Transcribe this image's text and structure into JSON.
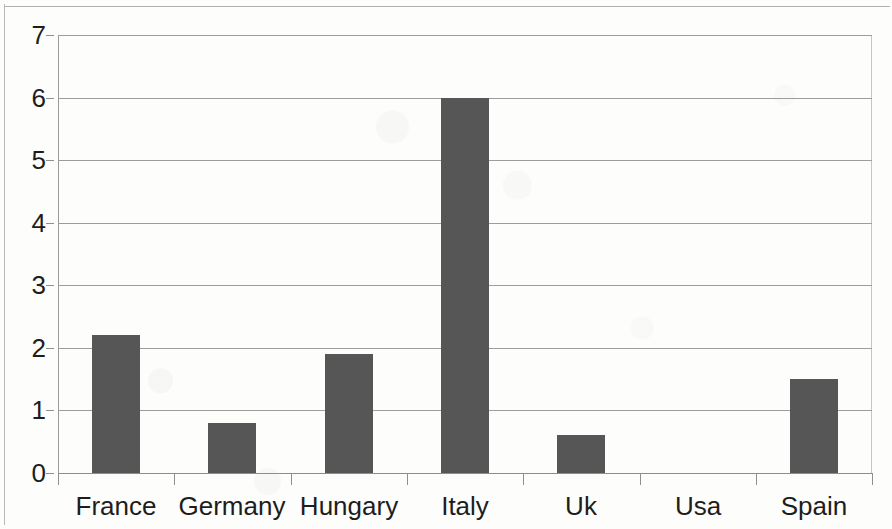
{
  "chart_data": {
    "type": "bar",
    "title": "",
    "subtitle": "",
    "xlabel": "",
    "ylabel": "",
    "categories": [
      "France",
      "Germany",
      "Hungary",
      "Italy",
      "Uk",
      "Usa",
      "Spain"
    ],
    "values": [
      2.2,
      0.8,
      1.9,
      6.0,
      0.6,
      0.0,
      1.5
    ],
    "series": [
      {
        "name": "",
        "values": [
          2.2,
          0.8,
          1.9,
          6.0,
          0.6,
          0.0,
          1.5
        ]
      }
    ],
    "ylim": [
      0,
      7
    ],
    "xlim": [
      0,
      7
    ],
    "y_ticks": [
      0,
      1,
      2,
      3,
      4,
      5,
      6,
      7
    ],
    "y_tick_labels": [
      "0",
      "1",
      "2",
      "3",
      "4",
      "5",
      "6",
      "7"
    ],
    "grid": true,
    "grid_axis": "y",
    "legend": false,
    "legend_position": "none",
    "bar_color": "#565656",
    "grid_color": "#9d9d9d",
    "axis_color": "#8f8f8f",
    "text_color": "#1d1d1d",
    "background_color": "#fdfdfc",
    "annotations": []
  },
  "geometry": {
    "plot_left": 58,
    "plot_top": 35,
    "plot_width": 814,
    "plot_height": 438,
    "category_step": 116.3,
    "bar_width": 48
  }
}
